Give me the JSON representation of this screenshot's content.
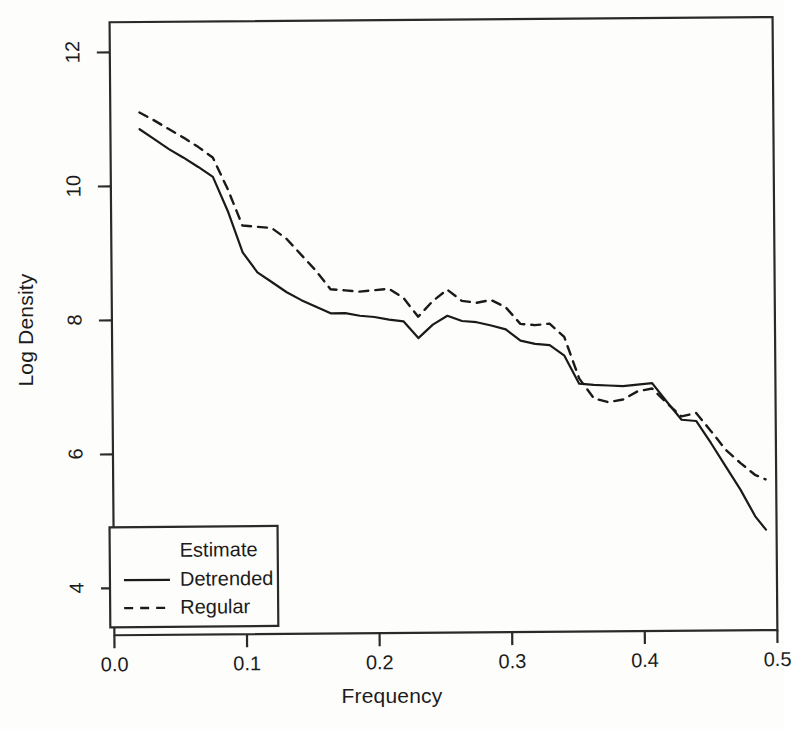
{
  "chart_data": {
    "type": "line",
    "title": "",
    "xlabel": "Frequency",
    "ylabel": "Log Density",
    "xlim": [
      0.0,
      0.5
    ],
    "ylim": [
      3.3,
      12.45
    ],
    "xticks": [
      "0.0",
      "0.1",
      "0.2",
      "0.3",
      "0.4",
      "0.5"
    ],
    "xtick_values": [
      0.0,
      0.1,
      0.2,
      0.3,
      0.4,
      0.5
    ],
    "yticks": [
      "4",
      "6",
      "8",
      "10",
      "12"
    ],
    "ytick_values": [
      4,
      6,
      8,
      10,
      12
    ],
    "grid": false,
    "legend_position": "bottom-left",
    "legend_title": "Estimate",
    "series": [
      {
        "name": "Detrended",
        "style": "solid",
        "color": "#1a1a1a",
        "x": [
          0.022,
          0.033,
          0.044,
          0.055,
          0.066,
          0.077,
          0.088,
          0.099,
          0.11,
          0.121,
          0.132,
          0.143,
          0.154,
          0.165,
          0.176,
          0.187,
          0.198,
          0.209,
          0.22,
          0.231,
          0.242,
          0.253,
          0.264,
          0.275,
          0.286,
          0.297,
          0.308,
          0.319,
          0.33,
          0.341,
          0.352,
          0.363,
          0.374,
          0.385,
          0.396,
          0.407,
          0.418,
          0.429,
          0.44,
          0.451,
          0.462,
          0.473,
          0.484,
          0.492
        ],
        "y": [
          10.85,
          10.7,
          10.55,
          10.42,
          10.28,
          10.13,
          9.62,
          9.0,
          8.7,
          8.55,
          8.4,
          8.28,
          8.18,
          8.08,
          8.08,
          8.04,
          8.02,
          7.98,
          7.95,
          7.7,
          7.9,
          8.03,
          7.95,
          7.93,
          7.88,
          7.82,
          7.65,
          7.6,
          7.58,
          7.42,
          7.0,
          6.98,
          6.97,
          6.96,
          6.98,
          7.0,
          6.72,
          6.45,
          6.43,
          6.1,
          5.75,
          5.4,
          5.0,
          4.8
        ]
      },
      {
        "name": "Regular",
        "style": "dashed",
        "color": "#1a1a1a",
        "x": [
          0.022,
          0.033,
          0.044,
          0.055,
          0.066,
          0.077,
          0.088,
          0.099,
          0.11,
          0.121,
          0.132,
          0.143,
          0.154,
          0.165,
          0.176,
          0.187,
          0.198,
          0.209,
          0.22,
          0.231,
          0.242,
          0.253,
          0.264,
          0.275,
          0.286,
          0.297,
          0.308,
          0.319,
          0.33,
          0.341,
          0.352,
          0.363,
          0.374,
          0.385,
          0.396,
          0.407,
          0.418,
          0.429,
          0.44,
          0.451,
          0.462,
          0.473,
          0.484,
          0.492
        ],
        "y": [
          11.1,
          10.98,
          10.85,
          10.72,
          10.58,
          10.42,
          9.95,
          9.4,
          9.38,
          9.36,
          9.2,
          8.96,
          8.72,
          8.44,
          8.42,
          8.4,
          8.42,
          8.44,
          8.3,
          8.02,
          8.25,
          8.42,
          8.25,
          8.22,
          8.26,
          8.15,
          7.9,
          7.88,
          7.9,
          7.7,
          7.08,
          6.78,
          6.72,
          6.76,
          6.88,
          6.92,
          6.7,
          6.5,
          6.55,
          6.28,
          6.0,
          5.8,
          5.62,
          5.55
        ]
      }
    ]
  },
  "legend": {
    "title": "Estimate",
    "items": [
      {
        "label": "Detrended",
        "style": "solid"
      },
      {
        "label": "Regular",
        "style": "dashed"
      }
    ]
  }
}
